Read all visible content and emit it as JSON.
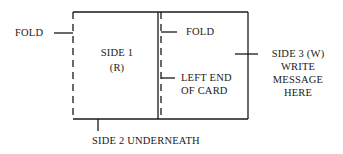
{
  "diagram": {
    "labels": {
      "fold_left": "FOLD",
      "side1_line1": "SIDE 1",
      "side1_line2": "(R)",
      "fold_inner": "FOLD",
      "left_end_line1": "LEFT END",
      "left_end_line2": "OF CARD",
      "side3_line1": "SIDE 3 (W)",
      "side3_line2": "WRITE",
      "side3_line3": "MESSAGE",
      "side3_line4": "HERE",
      "side2": "SIDE 2 UNDERNEATH"
    },
    "colors": {
      "line": "#1a1a1a",
      "background": "#ffffff"
    }
  }
}
